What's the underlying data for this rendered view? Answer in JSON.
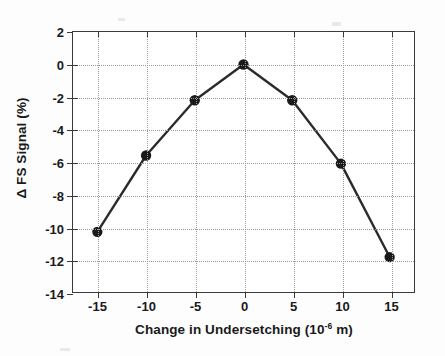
{
  "chart_data": {
    "type": "line",
    "title": "",
    "xlabel": "Change in Undersetching (10⁻⁶ m)",
    "xlabel_text": "Change in Undersetching (10",
    "xlabel_exponent": "-6",
    "xlabel_tail": " m)",
    "ylabel": "Δ FS Signal (%)",
    "x": [
      -15,
      -10,
      -5,
      0,
      5,
      10,
      15
    ],
    "values": [
      -10.3,
      -5.6,
      -2.2,
      0.0,
      -2.2,
      -6.1,
      -11.85
    ],
    "series": [
      {
        "name": "Δ FS Signal",
        "values": [
          -10.3,
          -5.6,
          -2.2,
          0.0,
          -2.2,
          -6.1,
          -11.85
        ]
      }
    ],
    "xlim": [
      -17.5,
      17.5
    ],
    "ylim": [
      -14,
      2
    ],
    "xticks": [
      -15,
      -10,
      -5,
      0,
      5,
      10,
      15
    ],
    "yticks": [
      2,
      0,
      -2,
      -4,
      -6,
      -8,
      -10,
      -12,
      -14
    ],
    "xtick_labels": [
      "-15",
      "-10",
      "-5",
      "0",
      "5",
      "10",
      "15"
    ],
    "ytick_labels": [
      "2",
      "0",
      "-2",
      "-4",
      "-6",
      "-8",
      "-10",
      "-12",
      "-14"
    ],
    "grid": true,
    "grid_style": "dotted",
    "legend": false,
    "legend_position": "none",
    "marker": "filled-circle",
    "line_color": "#2b2b2b",
    "marker_color": "#1a1a1a",
    "grid_color": "#9a9a9a",
    "axis_color": "#3a3a3a",
    "background_color": "#ffffff"
  }
}
